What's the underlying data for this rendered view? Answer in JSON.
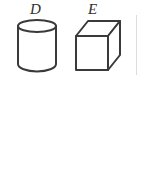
{
  "figure": {
    "background_color": "#ffffff",
    "stroke_color": "#3a3a3a",
    "fill_color": "#ffffff",
    "stroke_width": 2,
    "canvas": {
      "width": 141,
      "height": 190
    },
    "artifact_color": "#dcdcdc",
    "labels": {
      "d": "D",
      "e": "E"
    },
    "solids": [
      {
        "id": "cylinder",
        "label": "D",
        "shape_name": "cylinder",
        "bounds": {
          "x": 18,
          "y": 20,
          "width": 38,
          "height": 52
        },
        "top_ellipse": {
          "cx": 37,
          "cy": 26,
          "rx": 19,
          "ry": 6
        },
        "body_height": 40
      },
      {
        "id": "cube",
        "label": "E",
        "shape_name": "cube",
        "bounds": {
          "x": 76,
          "y": 21,
          "width": 44,
          "height": 49
        },
        "front_face": {
          "x": 76,
          "y": 36,
          "width": 32,
          "height": 34
        },
        "depth_offset": {
          "dx": 12,
          "dy": -15
        }
      }
    ]
  }
}
